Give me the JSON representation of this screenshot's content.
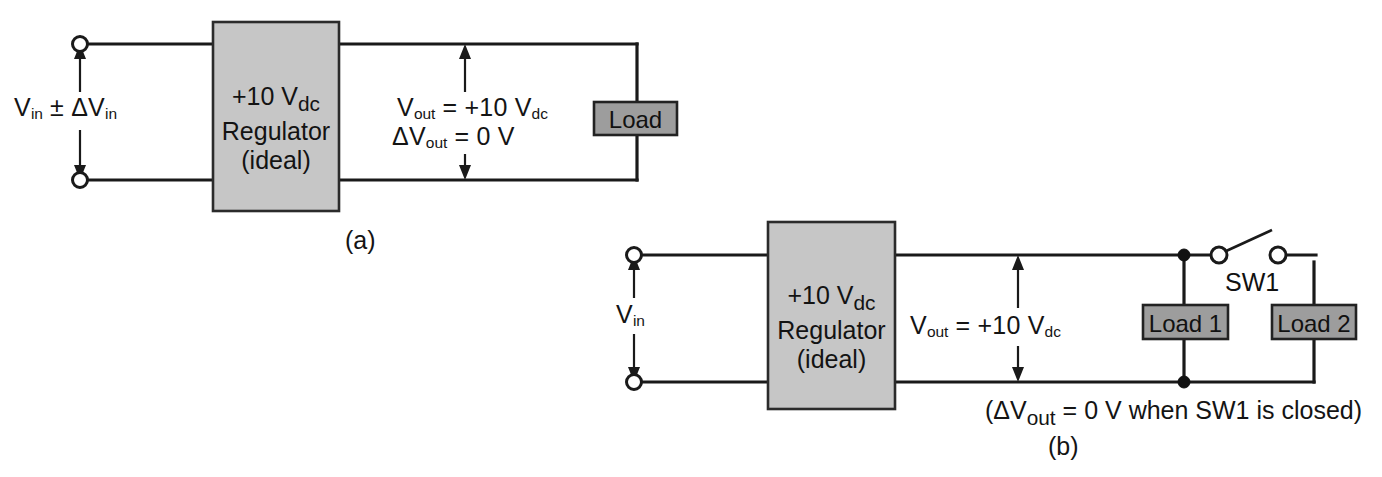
{
  "figure": {
    "type": "electronic-schematic",
    "background_color": "#ffffff",
    "line_color": "#1a1a1a",
    "regulator_fill": "#c6c6c6",
    "load_fill": "#9d9d9d"
  },
  "panel_a": {
    "caption": "(a)",
    "source_label_main": "V",
    "source_label": "V in ± ΔV in",
    "source_label_parts": {
      "v1": "V",
      "sub1": "in",
      "op": " ± ",
      "delta": "ΔV",
      "sub2": "in"
    },
    "regulator": {
      "line1_text": "+10 V",
      "line1_sub": "dc",
      "line2": "Regulator",
      "line3": "(ideal)"
    },
    "output_line1": {
      "v": "V",
      "sub": "out",
      "rest": " = +10 V",
      "sub2": "dc"
    },
    "output_line2": {
      "v": "ΔV",
      "sub": "out",
      "rest": " = 0 V"
    },
    "load": {
      "label": "Load"
    },
    "terminals": 2
  },
  "panel_b": {
    "caption": "(b)",
    "source_label_parts": {
      "v1": "V",
      "sub1": "in"
    },
    "regulator": {
      "line1_text": "+10 V",
      "line1_sub": "dc",
      "line2": "Regulator",
      "line3": "(ideal)"
    },
    "output_line1": {
      "v": "V",
      "sub": "out",
      "rest": " = +10 V",
      "sub2": "dc"
    },
    "loads": [
      {
        "label": "Load 1"
      },
      {
        "label": "Load 2"
      }
    ],
    "switch": {
      "label": "SW1",
      "state": "open"
    },
    "note_parts": {
      "open_paren": "(ΔV",
      "sub": "out",
      "rest": " = 0 V when SW1 is closed)"
    },
    "terminals": 2
  }
}
